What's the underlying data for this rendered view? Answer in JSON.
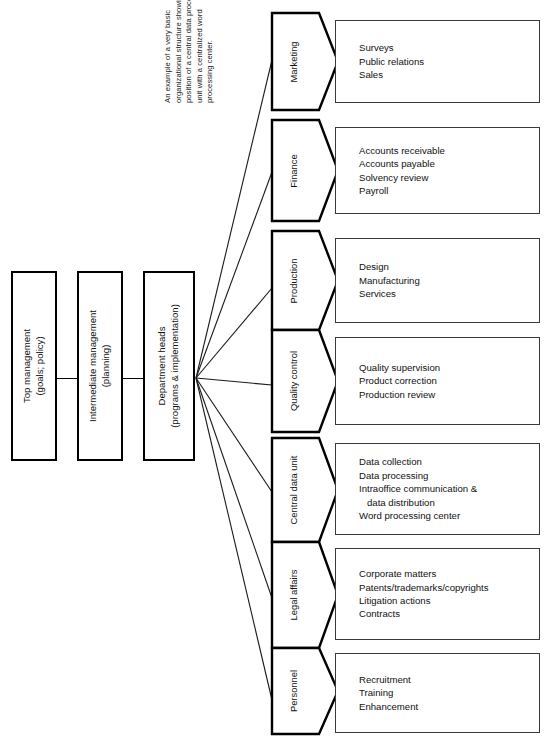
{
  "caption": {
    "text": "An example of a very basic organizational structure showing position of a central data processing unit with a centralized word processing center."
  },
  "management_levels": [
    {
      "line1": "Top management",
      "line2": "(goals; policy)"
    },
    {
      "line1": "Intermediate management",
      "line2": "(planning)"
    },
    {
      "line1": "Department heads",
      "line2": "(programs & implementation)"
    }
  ],
  "departments": [
    {
      "name": "Marketing",
      "items": [
        "Surveys",
        "Public relations",
        "Sales"
      ]
    },
    {
      "name": "Finance",
      "items": [
        "Accounts receivable",
        "Accounts payable",
        "Solvency review",
        "Payroll"
      ]
    },
    {
      "name": "Production",
      "items": [
        "Design",
        "Manufacturing",
        "Services"
      ]
    },
    {
      "name": "Quality control",
      "items": [
        "Quality supervision",
        "Product correction",
        "Production review"
      ]
    },
    {
      "name": "Central data unit",
      "items": [
        "Data collection",
        "Data processing",
        "Intraoffice communication &",
        "   data distribution",
        "Word processing center"
      ]
    },
    {
      "name": "Legal affairs",
      "items": [
        "Corporate matters",
        "Patents/trademarks/copyrights",
        "Litigation actions",
        "Contracts"
      ]
    },
    {
      "name": "Personnel",
      "items": [
        "Recruitment",
        "Training",
        "Enhancement"
      ]
    }
  ],
  "colors": {
    "stroke_heavy": "#000000",
    "stroke_light": "#3a3a3a",
    "background": "#ffffff",
    "text": "#111111"
  }
}
